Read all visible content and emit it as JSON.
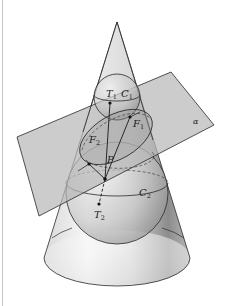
{
  "figure": {
    "type": "Dandelin spheres diagram (ellipse as conic section)",
    "labels": {
      "T1": {
        "main": "T",
        "sub": "1"
      },
      "C1": {
        "main": "C",
        "sub": "1"
      },
      "F1": {
        "main": "F",
        "sub": "1"
      },
      "F2": {
        "main": "F",
        "sub": "2"
      },
      "P": {
        "main": "P"
      },
      "C2": {
        "main": "C",
        "sub": "2"
      },
      "T2": {
        "main": "T",
        "sub": "2"
      },
      "alpha": {
        "main": "α"
      }
    },
    "colors": {
      "background": "#ffffff",
      "stroke": "#2a2a2a",
      "plane_fill": "#bdbdbd",
      "cone_light": "#f4f4f4",
      "cone_dark": "#8a8a8a",
      "border": "#c8c8c8"
    }
  }
}
